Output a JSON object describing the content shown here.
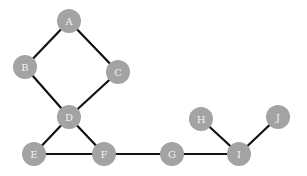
{
  "graph": {
    "node_color": "#a3a3a3",
    "label_color": "#f2f2f2",
    "edge_color": "#111111",
    "nodes": [
      {
        "id": "A",
        "label": "A",
        "x": 69,
        "y": 21
      },
      {
        "id": "B",
        "label": "B",
        "x": 25,
        "y": 67
      },
      {
        "id": "C",
        "label": "C",
        "x": 118,
        "y": 72
      },
      {
        "id": "D",
        "label": "D",
        "x": 69,
        "y": 117
      },
      {
        "id": "E",
        "label": "E",
        "x": 34,
        "y": 154
      },
      {
        "id": "F",
        "label": "F",
        "x": 104,
        "y": 154
      },
      {
        "id": "G",
        "label": "G",
        "x": 172,
        "y": 154
      },
      {
        "id": "H",
        "label": "H",
        "x": 201,
        "y": 119
      },
      {
        "id": "I",
        "label": "I",
        "x": 239,
        "y": 154
      },
      {
        "id": "J",
        "label": "J",
        "x": 278,
        "y": 117
      }
    ],
    "edges": [
      [
        "A",
        "B"
      ],
      [
        "A",
        "C"
      ],
      [
        "B",
        "D"
      ],
      [
        "C",
        "D"
      ],
      [
        "D",
        "E"
      ],
      [
        "D",
        "F"
      ],
      [
        "E",
        "F"
      ],
      [
        "F",
        "G"
      ],
      [
        "G",
        "I"
      ],
      [
        "H",
        "I"
      ],
      [
        "I",
        "J"
      ]
    ]
  }
}
